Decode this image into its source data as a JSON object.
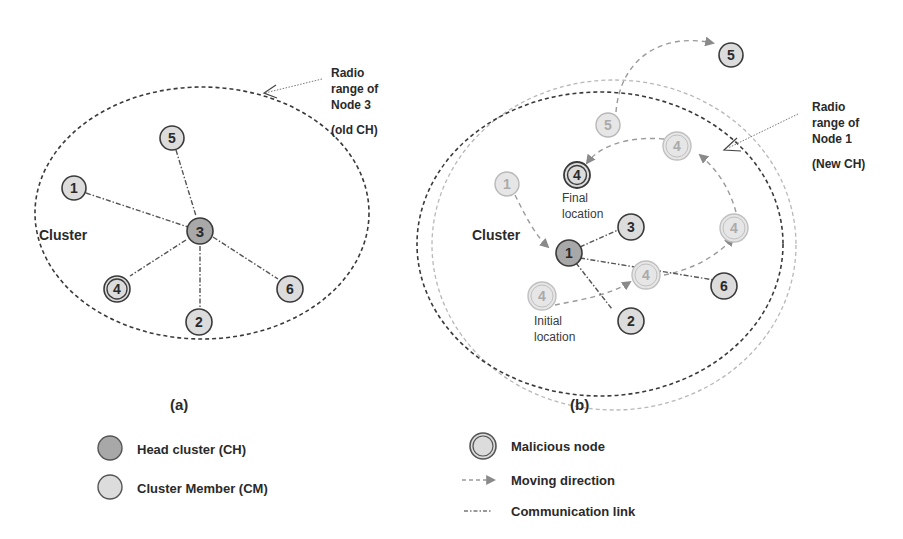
{
  "colors": {
    "head_fill": "#a8a8a8",
    "member_fill": "#dcdcdc",
    "faded_fill": "#e6e6e6",
    "stroke": "#3a3a3a",
    "faded_stroke": "#b0b0b0",
    "arrow": "#8a8a8a",
    "text": "#2a2a2a"
  },
  "panel_a": {
    "caption": "(a)",
    "cluster_label": "Cluster",
    "range_note": [
      "Radio",
      "range of",
      "Node 3",
      "(old CH)"
    ],
    "nodes": [
      {
        "id": "1",
        "role": "member"
      },
      {
        "id": "2",
        "role": "member"
      },
      {
        "id": "3",
        "role": "head"
      },
      {
        "id": "4",
        "role": "malicious"
      },
      {
        "id": "5",
        "role": "member"
      },
      {
        "id": "6",
        "role": "member"
      }
    ]
  },
  "panel_b": {
    "caption": "(b)",
    "cluster_label": "Cluster",
    "range_note": [
      "Radio",
      "range of",
      "Node 1",
      "(New CH)"
    ],
    "final_location": [
      "Final",
      "location"
    ],
    "initial_location": [
      "Initial",
      "location"
    ],
    "nodes": {
      "n1_old": "1",
      "n1": "1",
      "n2": "2",
      "n3": "3",
      "n4_final": "4",
      "n4_initial": "4",
      "n4_step1": "4",
      "n4_step2": "4",
      "n4_step3": "4",
      "n5_old": "5",
      "n5_new": "5",
      "n6": "6"
    }
  },
  "legend": {
    "head": "Head cluster (CH)",
    "member": "Cluster Member (CM)",
    "malicious": "Malicious node",
    "moving": "Moving direction",
    "link": "Communication link"
  }
}
